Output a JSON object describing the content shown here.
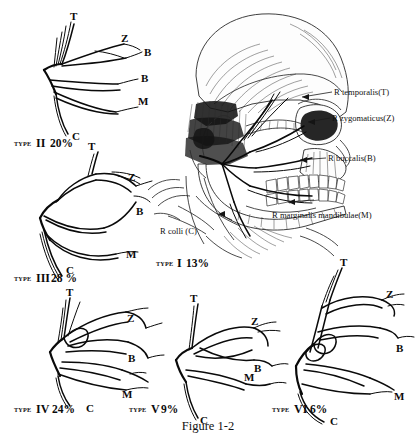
{
  "figure": {
    "caption": "Figure 1-2"
  },
  "anatomical_labels": [
    {
      "id": "temporalis",
      "text": "R temporalis(T)",
      "letter": "T"
    },
    {
      "id": "zygomaticus",
      "text": "R zygomaticus(Z)",
      "letter": "Z"
    },
    {
      "id": "buccalis",
      "text": "R buccalis(B)",
      "letter": "B"
    },
    {
      "id": "marginalis-mandibulae",
      "text": "R marginalis mandibulae(M)",
      "letter": "M"
    },
    {
      "id": "colli",
      "text": "R colli (C)",
      "letter": "C"
    }
  ],
  "types": [
    {
      "id": "type-1",
      "word": "TYPE",
      "numeral": "I",
      "percent": "13%",
      "branches": [
        "T",
        "Z",
        "B",
        "M",
        "C"
      ]
    },
    {
      "id": "type-2",
      "word": "TYPE",
      "numeral": "II",
      "percent": "20%",
      "branches": [
        "T",
        "Z",
        "B",
        "B",
        "M",
        "C"
      ]
    },
    {
      "id": "type-3",
      "word": "TYPE",
      "numeral": "III",
      "percent": "28 %",
      "branches": [
        "T",
        "Z",
        "B",
        "M",
        "C"
      ]
    },
    {
      "id": "type-4",
      "word": "TYPE",
      "numeral": "IV",
      "percent": "24%",
      "branches": [
        "T",
        "Z",
        "B",
        "M",
        "C"
      ]
    },
    {
      "id": "type-5",
      "word": "TYPE",
      "numeral": "V",
      "percent": "9%",
      "branches": [
        "T",
        "Z",
        "B",
        "M",
        "C"
      ]
    },
    {
      "id": "type-6",
      "word": "TYPE",
      "numeral": "VI",
      "percent": "6%",
      "branches": [
        "T",
        "Z",
        "B",
        "M",
        "C"
      ]
    }
  ],
  "colors": {
    "ink": "#0a0a0a",
    "paper": "#ffffff",
    "shade": "#2a2a2a"
  }
}
